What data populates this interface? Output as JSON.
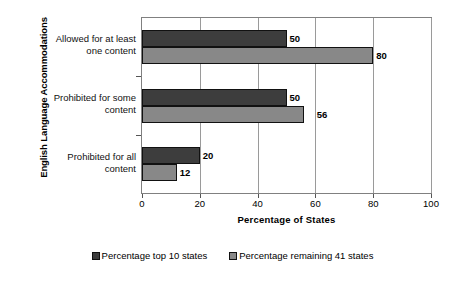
{
  "chart_data": {
    "type": "bar",
    "orientation": "horizontal",
    "title": "",
    "xlabel": "Percentage of States",
    "ylabel": "English Language Accommodations",
    "xlim": [
      0,
      100
    ],
    "xticks": [
      0,
      20,
      40,
      60,
      80,
      100
    ],
    "xtick_labels": [
      "0",
      "20",
      "40",
      "60",
      "80",
      "100"
    ],
    "grid": true,
    "grid_axis": "x",
    "legend_position": "bottom",
    "categories": [
      "Allowed for at least one content",
      "Prohibited for some content",
      "Prohibited for all content"
    ],
    "category_lines": [
      [
        "Allowed for at least",
        "one content"
      ],
      [
        "Prohibited for some",
        "content"
      ],
      [
        "Prohibited for all",
        "content"
      ]
    ],
    "series": [
      {
        "name": "Percentage top 10 states",
        "color": "#3d3d3d",
        "values": [
          50,
          50,
          20
        ],
        "value_labels": [
          "50",
          "50",
          "20"
        ]
      },
      {
        "name": "Percentage remaining 41 states",
        "color": "#888888",
        "values": [
          80,
          56,
          12
        ],
        "value_labels": [
          "80",
          "56",
          "12"
        ]
      }
    ]
  },
  "axes": {
    "y_title": "English Language Accommodations",
    "x_title": "Percentage of States"
  },
  "legend": {
    "items": [
      {
        "label": "Percentage top 10 states",
        "color": "#3d3d3d"
      },
      {
        "label": "Percentage remaining 41 states",
        "color": "#888888"
      }
    ]
  }
}
